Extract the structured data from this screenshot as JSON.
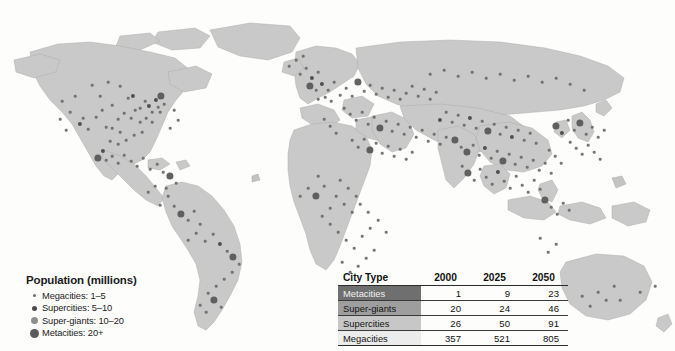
{
  "figure": {
    "type": "thematic-world-map",
    "background_color": "#fdfdfb",
    "land_color": "#c9c9c9"
  },
  "legend": {
    "title": "Population (millions)",
    "items": [
      {
        "label": "Megacities: 1–5",
        "icon": "dot-icon",
        "size_px": 3,
        "color": "#6b6b6b"
      },
      {
        "label": "Supercities: 5–10",
        "icon": "dot-icon",
        "size_px": 5,
        "color": "#4a4a4a"
      },
      {
        "label": "Super-giants: 10–20",
        "icon": "dot-icon",
        "size_px": 7,
        "color": "#8f8f8f"
      },
      {
        "label": "Metacities: 20+",
        "icon": "dot-icon",
        "size_px": 9,
        "color": "#5a5a5a"
      }
    ]
  },
  "table": {
    "columns": [
      "City Type",
      "2000",
      "2025",
      "2050"
    ],
    "rows": [
      {
        "type": "Metacities",
        "v2000": "1",
        "v2025": "9",
        "v2050": "23",
        "fill": "#6f6f6f"
      },
      {
        "type": "Super-giants",
        "v2000": "20",
        "v2025": "24",
        "v2050": "46",
        "fill": "#9e9e9e"
      },
      {
        "type": "Supercities",
        "v2000": "26",
        "v2025": "50",
        "v2050": "91",
        "fill": "#c7c7c7"
      },
      {
        "type": "Megacities",
        "v2000": "357",
        "v2025": "521",
        "v2050": "805",
        "fill": "#ececec"
      }
    ]
  },
  "chart_data": {
    "type": "table",
    "title": "Population (millions)",
    "categories": [
      "Metacities",
      "Super-giants",
      "Supercities",
      "Megacities"
    ],
    "series": [
      {
        "name": "2000",
        "values": [
          1,
          20,
          26,
          357
        ]
      },
      {
        "name": "2025",
        "values": [
          9,
          24,
          50,
          521
        ]
      },
      {
        "name": "2050",
        "values": [
          23,
          46,
          91,
          805
        ]
      }
    ],
    "xlabel": "City Type",
    "ylabel": "Number of cities",
    "legend_position": "bottom-left",
    "grid": false
  },
  "city_dots": [
    {
      "x": 62,
      "y": 101,
      "c": "mega"
    },
    {
      "x": 75,
      "y": 96,
      "c": "mega"
    },
    {
      "x": 83,
      "y": 118,
      "c": "mega"
    },
    {
      "x": 80,
      "y": 124,
      "c": "super"
    },
    {
      "x": 88,
      "y": 129,
      "c": "mega"
    },
    {
      "x": 96,
      "y": 117,
      "c": "mega"
    },
    {
      "x": 102,
      "y": 110,
      "c": "mega"
    },
    {
      "x": 100,
      "y": 96,
      "c": "mega"
    },
    {
      "x": 112,
      "y": 128,
      "c": "mega"
    },
    {
      "x": 120,
      "y": 132,
      "c": "mega"
    },
    {
      "x": 128,
      "y": 98,
      "c": "mega"
    },
    {
      "x": 133,
      "y": 96,
      "c": "super"
    },
    {
      "x": 140,
      "y": 108,
      "c": "mega"
    },
    {
      "x": 135,
      "y": 110,
      "c": "mega"
    },
    {
      "x": 145,
      "y": 101,
      "c": "mega"
    },
    {
      "x": 149,
      "y": 106,
      "c": "super"
    },
    {
      "x": 152,
      "y": 112,
      "c": "mega"
    },
    {
      "x": 156,
      "y": 100,
      "c": "super"
    },
    {
      "x": 158,
      "y": 107,
      "c": "mega"
    },
    {
      "x": 161,
      "y": 96,
      "c": "meta"
    },
    {
      "x": 164,
      "y": 104,
      "c": "mega"
    },
    {
      "x": 160,
      "y": 112,
      "c": "mega"
    },
    {
      "x": 146,
      "y": 118,
      "c": "mega"
    },
    {
      "x": 152,
      "y": 122,
      "c": "mega"
    },
    {
      "x": 140,
      "y": 122,
      "c": "mega"
    },
    {
      "x": 131,
      "y": 118,
      "c": "mega"
    },
    {
      "x": 124,
      "y": 113,
      "c": "mega"
    },
    {
      "x": 118,
      "y": 119,
      "c": "mega"
    },
    {
      "x": 112,
      "y": 105,
      "c": "mega"
    },
    {
      "x": 106,
      "y": 127,
      "c": "mega"
    },
    {
      "x": 126,
      "y": 140,
      "c": "mega"
    },
    {
      "x": 134,
      "y": 135,
      "c": "mega"
    },
    {
      "x": 142,
      "y": 132,
      "c": "mega"
    },
    {
      "x": 118,
      "y": 144,
      "c": "mega"
    },
    {
      "x": 110,
      "y": 141,
      "c": "mega"
    },
    {
      "x": 103,
      "y": 151,
      "c": "super"
    },
    {
      "x": 98,
      "y": 158,
      "c": "meta"
    },
    {
      "x": 106,
      "y": 160,
      "c": "mega"
    },
    {
      "x": 112,
      "y": 156,
      "c": "mega"
    },
    {
      "x": 118,
      "y": 163,
      "c": "mega"
    },
    {
      "x": 124,
      "y": 155,
      "c": "mega"
    },
    {
      "x": 131,
      "y": 161,
      "c": "mega"
    },
    {
      "x": 137,
      "y": 166,
      "c": "mega"
    },
    {
      "x": 143,
      "y": 158,
      "c": "mega"
    },
    {
      "x": 150,
      "y": 169,
      "c": "mega"
    },
    {
      "x": 157,
      "y": 164,
      "c": "mega"
    },
    {
      "x": 163,
      "y": 172,
      "c": "mega"
    },
    {
      "x": 170,
      "y": 176,
      "c": "meta"
    },
    {
      "x": 176,
      "y": 183,
      "c": "mega"
    },
    {
      "x": 166,
      "y": 188,
      "c": "mega"
    },
    {
      "x": 155,
      "y": 186,
      "c": "mega"
    },
    {
      "x": 148,
      "y": 192,
      "c": "mega"
    },
    {
      "x": 174,
      "y": 206,
      "c": "mega"
    },
    {
      "x": 181,
      "y": 214,
      "c": "meta"
    },
    {
      "x": 188,
      "y": 220,
      "c": "mega"
    },
    {
      "x": 194,
      "y": 211,
      "c": "mega"
    },
    {
      "x": 200,
      "y": 224,
      "c": "mega"
    },
    {
      "x": 196,
      "y": 233,
      "c": "mega"
    },
    {
      "x": 188,
      "y": 240,
      "c": "mega"
    },
    {
      "x": 205,
      "y": 241,
      "c": "mega"
    },
    {
      "x": 213,
      "y": 234,
      "c": "mega"
    },
    {
      "x": 220,
      "y": 244,
      "c": "super"
    },
    {
      "x": 227,
      "y": 251,
      "c": "mega"
    },
    {
      "x": 233,
      "y": 257,
      "c": "meta"
    },
    {
      "x": 239,
      "y": 264,
      "c": "mega"
    },
    {
      "x": 232,
      "y": 272,
      "c": "mega"
    },
    {
      "x": 224,
      "y": 279,
      "c": "mega"
    },
    {
      "x": 216,
      "y": 286,
      "c": "mega"
    },
    {
      "x": 208,
      "y": 293,
      "c": "mega"
    },
    {
      "x": 214,
      "y": 300,
      "c": "meta"
    },
    {
      "x": 221,
      "y": 307,
      "c": "mega"
    },
    {
      "x": 206,
      "y": 312,
      "c": "mega"
    },
    {
      "x": 200,
      "y": 305,
      "c": "mega"
    },
    {
      "x": 168,
      "y": 196,
      "c": "mega"
    },
    {
      "x": 160,
      "y": 205,
      "c": "mega"
    },
    {
      "x": 300,
      "y": 74,
      "c": "mega"
    },
    {
      "x": 306,
      "y": 68,
      "c": "mega"
    },
    {
      "x": 312,
      "y": 78,
      "c": "super"
    },
    {
      "x": 318,
      "y": 72,
      "c": "mega"
    },
    {
      "x": 310,
      "y": 86,
      "c": "meta"
    },
    {
      "x": 316,
      "y": 90,
      "c": "mega"
    },
    {
      "x": 322,
      "y": 84,
      "c": "super"
    },
    {
      "x": 328,
      "y": 90,
      "c": "mega"
    },
    {
      "x": 334,
      "y": 82,
      "c": "mega"
    },
    {
      "x": 325,
      "y": 97,
      "c": "mega"
    },
    {
      "x": 331,
      "y": 101,
      "c": "mega"
    },
    {
      "x": 318,
      "y": 99,
      "c": "mega"
    },
    {
      "x": 340,
      "y": 95,
      "c": "mega"
    },
    {
      "x": 346,
      "y": 88,
      "c": "mega"
    },
    {
      "x": 352,
      "y": 96,
      "c": "mega"
    },
    {
      "x": 358,
      "y": 82,
      "c": "meta"
    },
    {
      "x": 364,
      "y": 91,
      "c": "mega"
    },
    {
      "x": 370,
      "y": 85,
      "c": "mega"
    },
    {
      "x": 376,
      "y": 94,
      "c": "mega"
    },
    {
      "x": 382,
      "y": 88,
      "c": "mega"
    },
    {
      "x": 388,
      "y": 97,
      "c": "mega"
    },
    {
      "x": 394,
      "y": 90,
      "c": "mega"
    },
    {
      "x": 400,
      "y": 99,
      "c": "mega"
    },
    {
      "x": 406,
      "y": 93,
      "c": "mega"
    },
    {
      "x": 412,
      "y": 86,
      "c": "mega"
    },
    {
      "x": 418,
      "y": 96,
      "c": "mega"
    },
    {
      "x": 424,
      "y": 89,
      "c": "mega"
    },
    {
      "x": 430,
      "y": 99,
      "c": "mega"
    },
    {
      "x": 436,
      "y": 92,
      "c": "mega"
    },
    {
      "x": 344,
      "y": 108,
      "c": "mega"
    },
    {
      "x": 350,
      "y": 114,
      "c": "mega"
    },
    {
      "x": 356,
      "y": 120,
      "c": "mega"
    },
    {
      "x": 362,
      "y": 112,
      "c": "mega"
    },
    {
      "x": 368,
      "y": 124,
      "c": "mega"
    },
    {
      "x": 374,
      "y": 117,
      "c": "mega"
    },
    {
      "x": 380,
      "y": 128,
      "c": "meta"
    },
    {
      "x": 386,
      "y": 121,
      "c": "mega"
    },
    {
      "x": 392,
      "y": 131,
      "c": "mega"
    },
    {
      "x": 398,
      "y": 124,
      "c": "mega"
    },
    {
      "x": 404,
      "y": 134,
      "c": "mega"
    },
    {
      "x": 410,
      "y": 127,
      "c": "mega"
    },
    {
      "x": 416,
      "y": 137,
      "c": "mega"
    },
    {
      "x": 422,
      "y": 130,
      "c": "mega"
    },
    {
      "x": 428,
      "y": 141,
      "c": "mega"
    },
    {
      "x": 434,
      "y": 134,
      "c": "mega"
    },
    {
      "x": 440,
      "y": 144,
      "c": "mega"
    },
    {
      "x": 446,
      "y": 137,
      "c": "mega"
    },
    {
      "x": 330,
      "y": 126,
      "c": "mega"
    },
    {
      "x": 336,
      "y": 133,
      "c": "mega"
    },
    {
      "x": 324,
      "y": 119,
      "c": "mega"
    },
    {
      "x": 352,
      "y": 140,
      "c": "mega"
    },
    {
      "x": 358,
      "y": 147,
      "c": "mega"
    },
    {
      "x": 364,
      "y": 139,
      "c": "mega"
    },
    {
      "x": 370,
      "y": 150,
      "c": "meta"
    },
    {
      "x": 376,
      "y": 143,
      "c": "mega"
    },
    {
      "x": 382,
      "y": 153,
      "c": "mega"
    },
    {
      "x": 388,
      "y": 146,
      "c": "mega"
    },
    {
      "x": 394,
      "y": 156,
      "c": "mega"
    },
    {
      "x": 400,
      "y": 149,
      "c": "mega"
    },
    {
      "x": 406,
      "y": 159,
      "c": "mega"
    },
    {
      "x": 412,
      "y": 152,
      "c": "mega"
    },
    {
      "x": 440,
      "y": 120,
      "c": "super"
    },
    {
      "x": 446,
      "y": 112,
      "c": "mega"
    },
    {
      "x": 452,
      "y": 122,
      "c": "mega"
    },
    {
      "x": 458,
      "y": 115,
      "c": "mega"
    },
    {
      "x": 464,
      "y": 125,
      "c": "mega"
    },
    {
      "x": 470,
      "y": 118,
      "c": "super"
    },
    {
      "x": 476,
      "y": 128,
      "c": "mega"
    },
    {
      "x": 482,
      "y": 121,
      "c": "mega"
    },
    {
      "x": 488,
      "y": 131,
      "c": "meta"
    },
    {
      "x": 494,
      "y": 124,
      "c": "mega"
    },
    {
      "x": 500,
      "y": 134,
      "c": "mega"
    },
    {
      "x": 506,
      "y": 127,
      "c": "mega"
    },
    {
      "x": 512,
      "y": 137,
      "c": "super"
    },
    {
      "x": 518,
      "y": 130,
      "c": "mega"
    },
    {
      "x": 524,
      "y": 140,
      "c": "mega"
    },
    {
      "x": 530,
      "y": 133,
      "c": "mega"
    },
    {
      "x": 536,
      "y": 143,
      "c": "mega"
    },
    {
      "x": 455,
      "y": 140,
      "c": "meta"
    },
    {
      "x": 461,
      "y": 147,
      "c": "mega"
    },
    {
      "x": 467,
      "y": 152,
      "c": "meta"
    },
    {
      "x": 473,
      "y": 145,
      "c": "mega"
    },
    {
      "x": 479,
      "y": 155,
      "c": "mega"
    },
    {
      "x": 485,
      "y": 148,
      "c": "super"
    },
    {
      "x": 491,
      "y": 158,
      "c": "mega"
    },
    {
      "x": 497,
      "y": 151,
      "c": "mega"
    },
    {
      "x": 503,
      "y": 161,
      "c": "meta"
    },
    {
      "x": 509,
      "y": 154,
      "c": "mega"
    },
    {
      "x": 515,
      "y": 164,
      "c": "mega"
    },
    {
      "x": 521,
      "y": 157,
      "c": "mega"
    },
    {
      "x": 527,
      "y": 167,
      "c": "mega"
    },
    {
      "x": 533,
      "y": 160,
      "c": "mega"
    },
    {
      "x": 539,
      "y": 170,
      "c": "mega"
    },
    {
      "x": 545,
      "y": 163,
      "c": "mega"
    },
    {
      "x": 551,
      "y": 173,
      "c": "mega"
    },
    {
      "x": 462,
      "y": 166,
      "c": "mega"
    },
    {
      "x": 468,
      "y": 173,
      "c": "meta"
    },
    {
      "x": 474,
      "y": 180,
      "c": "mega"
    },
    {
      "x": 480,
      "y": 169,
      "c": "mega"
    },
    {
      "x": 486,
      "y": 177,
      "c": "mega"
    },
    {
      "x": 492,
      "y": 184,
      "c": "mega"
    },
    {
      "x": 498,
      "y": 172,
      "c": "super"
    },
    {
      "x": 504,
      "y": 181,
      "c": "mega"
    },
    {
      "x": 510,
      "y": 188,
      "c": "mega"
    },
    {
      "x": 516,
      "y": 176,
      "c": "mega"
    },
    {
      "x": 522,
      "y": 185,
      "c": "mega"
    },
    {
      "x": 528,
      "y": 192,
      "c": "mega"
    },
    {
      "x": 534,
      "y": 180,
      "c": "mega"
    },
    {
      "x": 540,
      "y": 189,
      "c": "mega"
    },
    {
      "x": 556,
      "y": 126,
      "c": "meta"
    },
    {
      "x": 562,
      "y": 133,
      "c": "super"
    },
    {
      "x": 568,
      "y": 120,
      "c": "mega"
    },
    {
      "x": 574,
      "y": 130,
      "c": "mega"
    },
    {
      "x": 580,
      "y": 123,
      "c": "meta"
    },
    {
      "x": 586,
      "y": 134,
      "c": "mega"
    },
    {
      "x": 592,
      "y": 127,
      "c": "mega"
    },
    {
      "x": 598,
      "y": 137,
      "c": "mega"
    },
    {
      "x": 604,
      "y": 130,
      "c": "mega"
    },
    {
      "x": 570,
      "y": 142,
      "c": "mega"
    },
    {
      "x": 576,
      "y": 148,
      "c": "mega"
    },
    {
      "x": 582,
      "y": 154,
      "c": "mega"
    },
    {
      "x": 588,
      "y": 145,
      "c": "mega"
    },
    {
      "x": 594,
      "y": 152,
      "c": "mega"
    },
    {
      "x": 600,
      "y": 159,
      "c": "mega"
    },
    {
      "x": 549,
      "y": 150,
      "c": "mega"
    },
    {
      "x": 555,
      "y": 156,
      "c": "mega"
    },
    {
      "x": 561,
      "y": 163,
      "c": "mega"
    },
    {
      "x": 545,
      "y": 200,
      "c": "meta"
    },
    {
      "x": 551,
      "y": 207,
      "c": "mega"
    },
    {
      "x": 557,
      "y": 214,
      "c": "mega"
    },
    {
      "x": 563,
      "y": 203,
      "c": "mega"
    },
    {
      "x": 569,
      "y": 210,
      "c": "mega"
    },
    {
      "x": 340,
      "y": 180,
      "c": "mega"
    },
    {
      "x": 348,
      "y": 188,
      "c": "mega"
    },
    {
      "x": 356,
      "y": 196,
      "c": "mega"
    },
    {
      "x": 344,
      "y": 204,
      "c": "mega"
    },
    {
      "x": 352,
      "y": 212,
      "c": "mega"
    },
    {
      "x": 336,
      "y": 196,
      "c": "mega"
    },
    {
      "x": 330,
      "y": 208,
      "c": "mega"
    },
    {
      "x": 360,
      "y": 204,
      "c": "mega"
    },
    {
      "x": 368,
      "y": 212,
      "c": "mega"
    },
    {
      "x": 322,
      "y": 216,
      "c": "mega"
    },
    {
      "x": 330,
      "y": 224,
      "c": "mega"
    },
    {
      "x": 338,
      "y": 232,
      "c": "mega"
    },
    {
      "x": 346,
      "y": 240,
      "c": "mega"
    },
    {
      "x": 354,
      "y": 248,
      "c": "mega"
    },
    {
      "x": 362,
      "y": 236,
      "c": "mega"
    },
    {
      "x": 370,
      "y": 228,
      "c": "mega"
    },
    {
      "x": 378,
      "y": 220,
      "c": "mega"
    },
    {
      "x": 386,
      "y": 232,
      "c": "mega"
    },
    {
      "x": 316,
      "y": 196,
      "c": "meta"
    },
    {
      "x": 308,
      "y": 188,
      "c": "mega"
    },
    {
      "x": 300,
      "y": 196,
      "c": "mega"
    },
    {
      "x": 324,
      "y": 186,
      "c": "mega"
    },
    {
      "x": 318,
      "y": 176,
      "c": "mega"
    },
    {
      "x": 366,
      "y": 258,
      "c": "mega"
    },
    {
      "x": 374,
      "y": 250,
      "c": "mega"
    },
    {
      "x": 358,
      "y": 266,
      "c": "mega"
    },
    {
      "x": 350,
      "y": 272,
      "c": "mega"
    },
    {
      "x": 342,
      "y": 262,
      "c": "mega"
    },
    {
      "x": 598,
      "y": 292,
      "c": "mega"
    },
    {
      "x": 606,
      "y": 300,
      "c": "mega"
    },
    {
      "x": 590,
      "y": 306,
      "c": "mega"
    },
    {
      "x": 614,
      "y": 286,
      "c": "mega"
    },
    {
      "x": 582,
      "y": 296,
      "c": "mega"
    },
    {
      "x": 620,
      "y": 300,
      "c": "mega"
    },
    {
      "x": 640,
      "y": 292,
      "c": "mega"
    },
    {
      "x": 655,
      "y": 286,
      "c": "mega"
    },
    {
      "x": 556,
      "y": 244,
      "c": "mega"
    },
    {
      "x": 548,
      "y": 252,
      "c": "mega"
    },
    {
      "x": 540,
      "y": 238,
      "c": "mega"
    },
    {
      "x": 92,
      "y": 85,
      "c": "mega"
    },
    {
      "x": 108,
      "y": 82,
      "c": "mega"
    },
    {
      "x": 120,
      "y": 86,
      "c": "mega"
    },
    {
      "x": 70,
      "y": 112,
      "c": "mega"
    },
    {
      "x": 66,
      "y": 130,
      "c": "mega"
    },
    {
      "x": 60,
      "y": 119,
      "c": "mega"
    },
    {
      "x": 174,
      "y": 110,
      "c": "mega"
    },
    {
      "x": 178,
      "y": 120,
      "c": "mega"
    },
    {
      "x": 170,
      "y": 128,
      "c": "mega"
    },
    {
      "x": 296,
      "y": 60,
      "c": "mega"
    },
    {
      "x": 303,
      "y": 56,
      "c": "mega"
    },
    {
      "x": 289,
      "y": 66,
      "c": "mega"
    },
    {
      "x": 430,
      "y": 74,
      "c": "mega"
    },
    {
      "x": 444,
      "y": 70,
      "c": "mega"
    },
    {
      "x": 458,
      "y": 76,
      "c": "mega"
    },
    {
      "x": 472,
      "y": 72,
      "c": "mega"
    },
    {
      "x": 486,
      "y": 78,
      "c": "mega"
    },
    {
      "x": 500,
      "y": 74,
      "c": "mega"
    },
    {
      "x": 514,
      "y": 80,
      "c": "mega"
    },
    {
      "x": 528,
      "y": 76,
      "c": "mega"
    },
    {
      "x": 542,
      "y": 82,
      "c": "mega"
    },
    {
      "x": 556,
      "y": 78,
      "c": "mega"
    },
    {
      "x": 570,
      "y": 84,
      "c": "mega"
    },
    {
      "x": 584,
      "y": 90,
      "c": "mega"
    }
  ]
}
